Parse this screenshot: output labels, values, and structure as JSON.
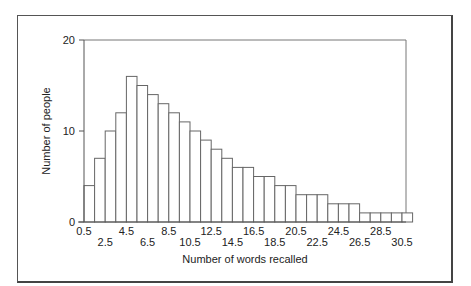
{
  "chart_data": {
    "type": "bar",
    "title": "",
    "xlabel": "Number of words recalled",
    "ylabel": "Number of people",
    "ylim": [
      0,
      20
    ],
    "xlim": [
      0.5,
      31.5
    ],
    "bin_width": 1,
    "bin_edges_start": 0.5,
    "yticks": [
      "0",
      "10",
      "20"
    ],
    "xticks_upper": [
      "0.5",
      "4.5",
      "8.5",
      "12.5",
      "16.5",
      "20.5",
      "24.5",
      "28.5"
    ],
    "xticks_lower": [
      "2.5",
      "6.5",
      "10.5",
      "14.5",
      "18.5",
      "22.5",
      "26.5",
      "30.5"
    ],
    "categories": [
      "1",
      "2",
      "3",
      "4",
      "5",
      "6",
      "7",
      "8",
      "9",
      "10",
      "11",
      "12",
      "13",
      "14",
      "15",
      "16",
      "17",
      "18",
      "19",
      "20",
      "21",
      "22",
      "23",
      "24",
      "25",
      "26",
      "27",
      "28",
      "29",
      "30",
      "31"
    ],
    "values": [
      4,
      7,
      10,
      12,
      16,
      15,
      14,
      13,
      12,
      11,
      10,
      9,
      8,
      7,
      6,
      6,
      5,
      5,
      4,
      4,
      3,
      3,
      3,
      2,
      2,
      2,
      1,
      1,
      1,
      1,
      1
    ],
    "grid": false,
    "legend": null,
    "bar_fill": "#ffffff",
    "bar_stroke": "#666666"
  }
}
